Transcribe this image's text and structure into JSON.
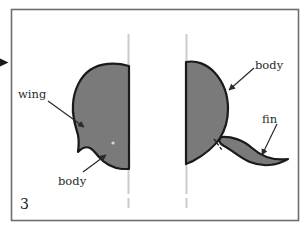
{
  "figure": {
    "number": "3",
    "caption_number_position": "bottom-left",
    "background_color": "#ffffff",
    "frame": {
      "border_color": "#6e6e6e",
      "x": 11,
      "y": 9,
      "width": 288,
      "height": 212
    },
    "shape_fill_color": "#7a7a7a",
    "shape_outline_color": "#1a1a1a",
    "guide_line_color": "#cfcfcf",
    "label_color": "#2b2b2b",
    "leader_line_color": "#333333",
    "external_marker": {
      "name": "left-edge-arrow-marker",
      "color": "#1a1a1a",
      "x": 0,
      "y": 58,
      "width": 9,
      "height": 9
    }
  },
  "labels": {
    "wing": "wing",
    "body_left": "body",
    "body_right": "body",
    "fin": "fin",
    "number": "3"
  },
  "guides": [
    {
      "name": "vertical-dashed-line-left",
      "x": 128,
      "y_start": 34,
      "y_end": 208
    },
    {
      "name": "vertical-dashed-line-right",
      "x": 186,
      "y_start": 34,
      "y_end": 208
    }
  ],
  "shapes": [
    {
      "name": "left-body-shape",
      "description": "rounded body with wing notch on lower-left, clipped at right guide line",
      "fill": "#7a7a7a",
      "stroke": "#1a1a1a"
    },
    {
      "name": "right-body-shape",
      "description": "rounded body clipped at left guide line, with fin extending right",
      "fill": "#7a7a7a",
      "stroke": "#1a1a1a"
    },
    {
      "name": "fin-shape",
      "description": "thin tapering curved fin extending to the right",
      "fill": "#7a7a7a",
      "stroke": "#1a1a1a"
    }
  ],
  "leaders": [
    {
      "name": "leader-wing",
      "from": [
        50,
        101
      ],
      "to": [
        84,
        127
      ]
    },
    {
      "name": "leader-body-left",
      "from": [
        82,
        172
      ],
      "to": [
        105,
        156
      ]
    },
    {
      "name": "leader-body-right",
      "from": [
        253,
        68
      ],
      "to": [
        228,
        90
      ]
    },
    {
      "name": "leader-fin",
      "from": [
        275,
        124
      ],
      "to": [
        262,
        155
      ]
    }
  ]
}
